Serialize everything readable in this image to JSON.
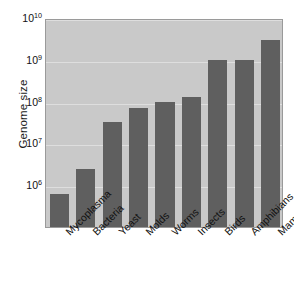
{
  "chart_data": {
    "type": "bar",
    "title": "",
    "xlabel": "",
    "ylabel": "Genome size",
    "yscale": "log",
    "ylim": [
      100000,
      10000000000
    ],
    "grid": true,
    "legend": false,
    "categories": [
      "Mycoplasma",
      "Bacteria",
      "Yeast",
      "Molds",
      "Worms",
      "Insects",
      "Birds",
      "Amphibians",
      "Mammals"
    ],
    "values": [
      600000,
      2500000,
      32000000,
      70000000,
      100000000,
      130000000,
      1000000000,
      1000000000,
      3000000000
    ],
    "ytick_values": [
      1000000,
      10000000,
      100000000,
      1000000000,
      10000000000
    ],
    "ytick_labels": [
      "10⁶",
      "10⁷",
      "10⁸",
      "10⁹",
      "10¹⁰"
    ],
    "ytick_mantissa": [
      "10",
      "10",
      "10",
      "10",
      "10"
    ],
    "ytick_exponent": [
      "6",
      "7",
      "8",
      "9",
      "10"
    ],
    "bar_color": "#5f5f5f",
    "plot_background": "#c9c9c9",
    "gridline_color": "#dedede",
    "page_background": "#ffffff",
    "axis_border_color": "#9a9a9a"
  }
}
